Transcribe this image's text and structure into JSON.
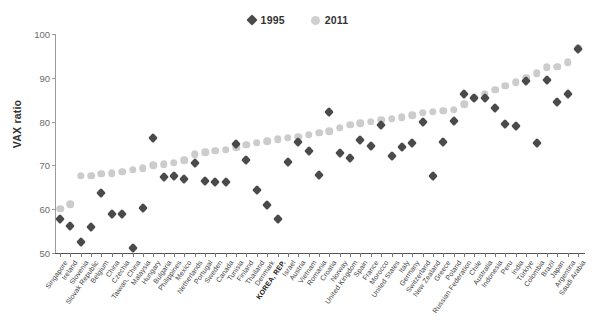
{
  "chart": {
    "ylabel": "VAX ratio",
    "legend": [
      {
        "label": "1995",
        "marker": "diamond",
        "color": "#4a4a4d"
      },
      {
        "label": "2011",
        "marker": "circle",
        "color": "#cccccc"
      }
    ]
  },
  "chart_data": {
    "type": "scatter",
    "title": "",
    "xlabel": "",
    "ylabel": "VAX ratio",
    "ylim": [
      50,
      100
    ],
    "yticks": [
      50,
      60,
      70,
      80,
      90,
      100
    ],
    "grid": false,
    "legend_position": "top-center",
    "highlight_category": "KOREA, REP.",
    "categories": [
      "Singapore",
      "Ireland",
      "Slovenia",
      "Slovak Republic",
      "Belgium",
      "China",
      "Czechia",
      "Taiwan, China",
      "Malaysia",
      "Hungary",
      "Bulgaria",
      "Philippines",
      "Mexico",
      "Netherlands",
      "Portugal",
      "Sweden",
      "Canada",
      "Tunisia",
      "Finland",
      "Thailand",
      "Denmark",
      "KOREA, REP.",
      "Israel",
      "Austria",
      "Vietnam",
      "Romania",
      "Croatia",
      "Norway",
      "United Kingdom",
      "Spain",
      "France",
      "Morocco",
      "United States",
      "Italy",
      "Germany",
      "Switzerland",
      "New Zealand",
      "Greece",
      "Poland",
      "Russian Federation",
      "Chile",
      "Australia",
      "Indonesia",
      "Peru",
      "India",
      "Türkiye",
      "Colombia",
      "Brazil",
      "Japan",
      "Argentina",
      "Saudi Arabia"
    ],
    "series": [
      {
        "name": "1995",
        "marker": "diamond",
        "color": "#4a4a4d",
        "values": [
          57.8,
          56.2,
          52.6,
          56.0,
          63.6,
          58.8,
          58.9,
          51.2,
          60.2,
          76.3,
          67.3,
          67.5,
          66.8,
          70.5,
          66.4,
          66.3,
          66.2,
          75.0,
          71.2,
          64.4,
          61.0,
          57.7,
          70.8,
          75.3,
          73.4,
          67.7,
          82.3,
          72.9,
          71.6,
          75.7,
          74.5,
          79.2,
          72.1,
          74.1,
          75.2,
          79.9,
          67.5,
          75.3,
          80.1,
          86.2,
          85.4,
          85.5,
          83.1,
          79.4,
          79.0,
          89.2,
          75.2,
          89.4,
          84.4,
          86.2,
          96.5
        ]
      },
      {
        "name": "2011",
        "marker": "circle",
        "color": "#cccccc",
        "values": [
          60.1,
          61.1,
          67.6,
          67.6,
          68.1,
          68.2,
          68.6,
          69.0,
          69.3,
          70.0,
          70.3,
          70.6,
          71.2,
          72.5,
          73.0,
          73.4,
          73.6,
          74.1,
          74.7,
          75.2,
          75.5,
          76.0,
          76.3,
          76.5,
          77.0,
          77.4,
          77.8,
          78.6,
          79.3,
          79.6,
          80.0,
          80.4,
          80.7,
          81.0,
          81.5,
          82.0,
          82.3,
          82.5,
          82.7,
          84.0,
          85.4,
          86.3,
          87.3,
          88.2,
          89.0,
          90.0,
          91.0,
          92.4,
          92.5,
          93.6,
          96.8
        ]
      }
    ]
  }
}
